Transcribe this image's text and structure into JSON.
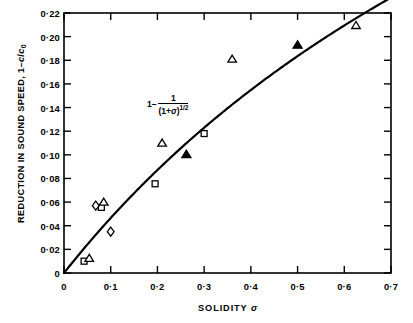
{
  "chart_data": {
    "type": "scatter",
    "title": "",
    "xlabel": "SOLIDITY  σ",
    "ylabel": "REDUCTION IN SOUND SPEED, 1−c/c₀",
    "xlim": [
      0,
      0.7
    ],
    "ylim": [
      0,
      0.22
    ],
    "grid": false,
    "legend": "none",
    "xticks": [
      0,
      0.1,
      0.2,
      0.3,
      0.4,
      0.5,
      0.6,
      0.7
    ],
    "xtick_labels": [
      "0",
      "0·1",
      "0·2",
      "0·3",
      "0·4",
      "0·5",
      "0·6",
      "0·7"
    ],
    "yticks": [
      0,
      0.02,
      0.04,
      0.06,
      0.08,
      0.1,
      0.12,
      0.14,
      0.16,
      0.18,
      0.2,
      0.22
    ],
    "ytick_labels": [
      "0",
      "0·02",
      "0·04",
      "0·06",
      "0·08",
      "0·10",
      "0·12",
      "0·14",
      "0·16",
      "0·18",
      "0·20",
      "0·22"
    ],
    "annotation": {
      "text": "1 − 1/(1+σ)^(1/2)",
      "lead": "1 −",
      "numerator": "1",
      "denominator": "(1+σ)",
      "exponent": "1/2",
      "x": 0.178,
      "y": 0.142
    },
    "curve": {
      "name": "1 − (1+σ)^(-1/2)",
      "formula": "1-1/sqrt(1+sigma)",
      "x_start": 0.0,
      "x_end": 0.705,
      "color": "#000000",
      "linewidth": 2.2
    },
    "series": [
      {
        "name": "open-square",
        "marker": "square",
        "filled": false,
        "points": [
          {
            "x": 0.043,
            "y": 0.01
          },
          {
            "x": 0.08,
            "y": 0.0555
          },
          {
            "x": 0.195,
            "y": 0.0755
          },
          {
            "x": 0.3,
            "y": 0.118
          }
        ]
      },
      {
        "name": "open-triangle",
        "marker": "triangle",
        "filled": false,
        "points": [
          {
            "x": 0.054,
            "y": 0.0125
          },
          {
            "x": 0.085,
            "y": 0.06
          },
          {
            "x": 0.21,
            "y": 0.11
          },
          {
            "x": 0.36,
            "y": 0.181
          },
          {
            "x": 0.625,
            "y": 0.2095
          }
        ]
      },
      {
        "name": "open-diamond",
        "marker": "diamond",
        "filled": false,
        "points": [
          {
            "x": 0.068,
            "y": 0.057
          },
          {
            "x": 0.1,
            "y": 0.035
          }
        ]
      },
      {
        "name": "filled-triangle",
        "marker": "triangle",
        "filled": true,
        "points": [
          {
            "x": 0.262,
            "y": 0.1005
          },
          {
            "x": 0.5,
            "y": 0.193
          }
        ]
      }
    ]
  }
}
